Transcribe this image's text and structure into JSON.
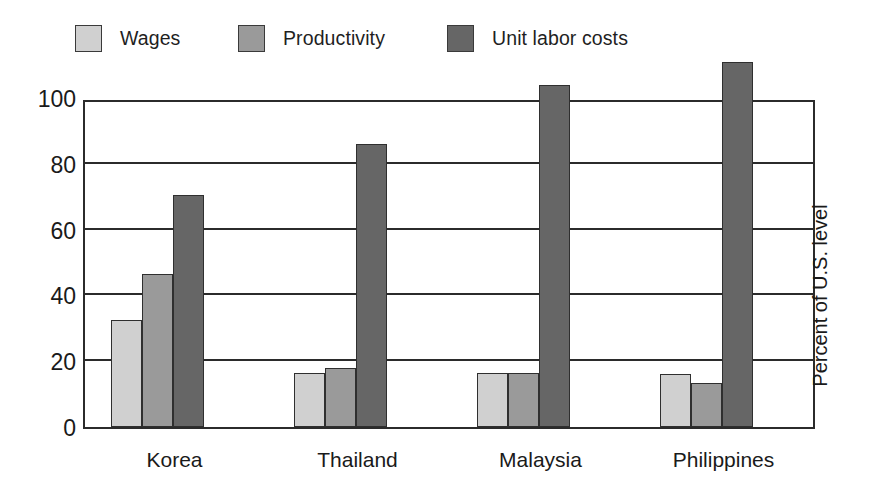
{
  "chart_data": {
    "type": "bar",
    "title": "",
    "subtitle": "",
    "xlabel": "",
    "ylabel": "Percent of U.S. level",
    "ylim": [
      0,
      110
    ],
    "yticks": [
      0,
      20,
      40,
      60,
      80,
      100
    ],
    "ytick_labels": [
      "0",
      "20",
      "40",
      "60",
      "80",
      "100"
    ],
    "grid": true,
    "legend_position": "top",
    "categories": [
      "Korea",
      "Thailand",
      "Malaysia",
      "Philippines"
    ],
    "series": [
      {
        "name": "Wages",
        "color": "#d0d0d0",
        "values": [
          32.5,
          16.5,
          16.5,
          16.0
        ]
      },
      {
        "name": "Productivity",
        "color": "#9a9a9a",
        "values": [
          46.5,
          18.0,
          16.5,
          13.5
        ]
      },
      {
        "name": "Unit labor costs",
        "color": "#666666",
        "values": [
          70.5,
          86.0,
          104.0,
          111.0
        ]
      }
    ]
  },
  "legend": {
    "items": [
      {
        "label": "Wages"
      },
      {
        "label": "Productivity"
      },
      {
        "label": "Unit labor costs"
      }
    ]
  },
  "axis": {
    "y_title": "Percent of U.S. level"
  }
}
